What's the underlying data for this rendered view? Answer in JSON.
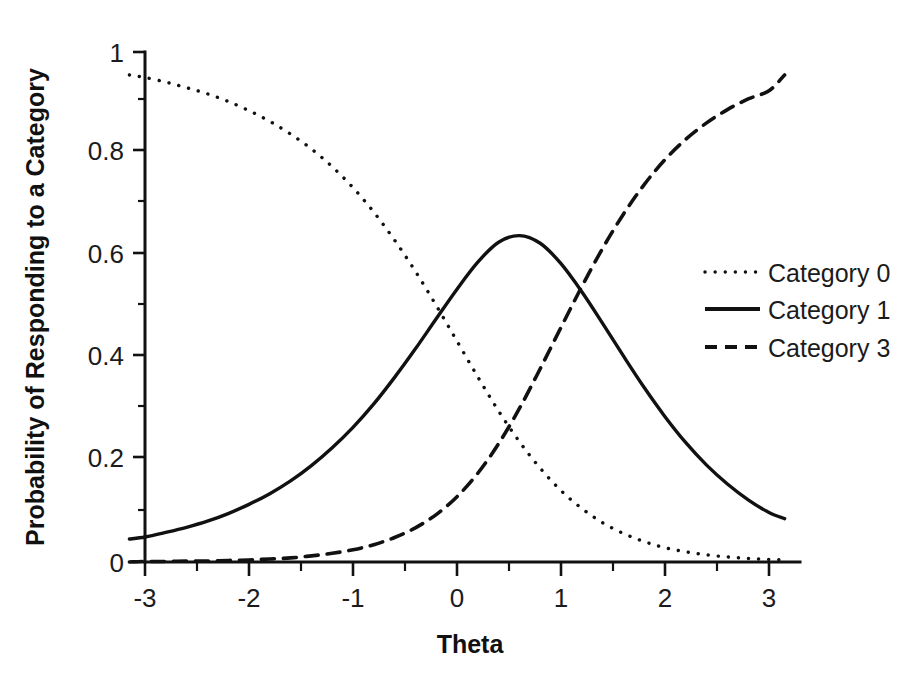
{
  "chart_data": {
    "type": "line",
    "title": "",
    "subtitle": "",
    "xlabel": "Theta",
    "ylabel": "Probability of Responding to a Category",
    "xlim": [
      -3.15,
      3.15
    ],
    "ylim": [
      0,
      1
    ],
    "xticks": [
      -3,
      -2,
      -1,
      0,
      1,
      2,
      3
    ],
    "xtick_labels": [
      "-3",
      "-2",
      "-1",
      "0",
      "1",
      "2",
      "3"
    ],
    "yticks": [
      0,
      0.2,
      0.4,
      0.6,
      0.8,
      1
    ],
    "ytick_labels": [
      "0",
      "0.2",
      "0.4",
      "0.6",
      "0.8",
      "1"
    ],
    "grid": false,
    "legend_position": "right",
    "line_color": "#111111",
    "background_color": "#ffffff",
    "x": [
      -3.15,
      -3.0,
      -2.8,
      -2.6,
      -2.4,
      -2.2,
      -2.0,
      -1.8,
      -1.6,
      -1.4,
      -1.2,
      -1.0,
      -0.8,
      -0.6,
      -0.4,
      -0.2,
      0.0,
      0.2,
      0.4,
      0.6,
      0.8,
      1.0,
      1.2,
      1.4,
      1.6,
      1.8,
      2.0,
      2.2,
      2.4,
      2.6,
      2.8,
      3.0,
      3.15
    ],
    "series": [
      {
        "name": "Category 0",
        "style": "dotted",
        "values": [
          0.955,
          0.95,
          0.941,
          0.93,
          0.918,
          0.903,
          0.885,
          0.864,
          0.839,
          0.81,
          0.775,
          0.734,
          0.686,
          0.631,
          0.57,
          0.503,
          0.433,
          0.363,
          0.296,
          0.236,
          0.184,
          0.14,
          0.105,
          0.077,
          0.056,
          0.04,
          0.028,
          0.02,
          0.014,
          0.01,
          0.007,
          0.005,
          0.004
        ]
      },
      {
        "name": "Category 1",
        "style": "solid",
        "values": [
          0.045,
          0.049,
          0.058,
          0.068,
          0.08,
          0.095,
          0.113,
          0.134,
          0.159,
          0.189,
          0.224,
          0.264,
          0.31,
          0.362,
          0.418,
          0.477,
          0.535,
          0.588,
          0.627,
          0.64,
          0.625,
          0.585,
          0.53,
          0.468,
          0.404,
          0.342,
          0.285,
          0.234,
          0.19,
          0.153,
          0.122,
          0.097,
          0.085
        ]
      },
      {
        "name": "Category 3",
        "style": "dashed",
        "values": [
          0.0,
          0.001,
          0.001,
          0.002,
          0.002,
          0.003,
          0.004,
          0.006,
          0.008,
          0.012,
          0.017,
          0.024,
          0.034,
          0.048,
          0.067,
          0.093,
          0.128,
          0.174,
          0.232,
          0.301,
          0.379,
          0.46,
          0.54,
          0.615,
          0.682,
          0.74,
          0.789,
          0.829,
          0.861,
          0.887,
          0.908,
          0.924,
          0.955
        ]
      }
    ]
  },
  "legend": {
    "items": [
      {
        "label": "Category 0",
        "style": "dotted"
      },
      {
        "label": "Category 1",
        "style": "solid"
      },
      {
        "label": "Category 3",
        "style": "dashed"
      }
    ]
  },
  "axes": {
    "x_title": "Theta",
    "y_title": "Probability of Responding to a Category",
    "x_tick_labels": [
      "-3",
      "-2",
      "-1",
      "0",
      "1",
      "2",
      "3"
    ],
    "y_tick_labels": [
      "1",
      "0.8",
      "0.6",
      "0.4",
      "0.2",
      "0"
    ]
  }
}
